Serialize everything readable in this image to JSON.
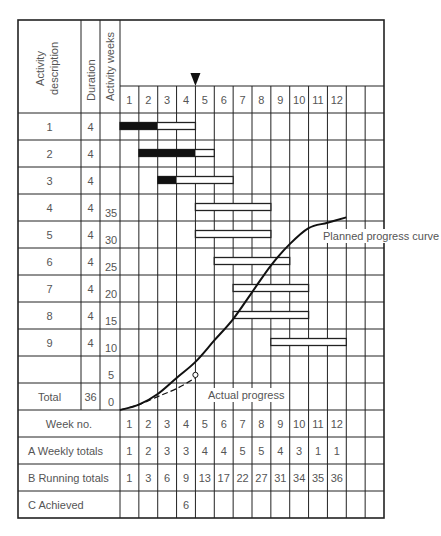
{
  "chart_data": {
    "type": "table",
    "title": "",
    "headers": {
      "activity_description": "Activity description",
      "duration": "Duration",
      "activity_weeks": "Activity weeks"
    },
    "weeks": [
      1,
      2,
      3,
      4,
      5,
      6,
      7,
      8,
      9,
      10,
      11,
      12
    ],
    "current_week_marker": {
      "position_after_week": 4,
      "symbol": "▼"
    },
    "activities": [
      {
        "id": "1",
        "duration": 4,
        "start_week": 1,
        "end_week": 4,
        "completed_weeks": [
          1,
          2
        ]
      },
      {
        "id": "2",
        "duration": 4,
        "start_week": 2,
        "end_week": 5,
        "completed_weeks": [
          2,
          3,
          4
        ]
      },
      {
        "id": "3",
        "duration": 4,
        "start_week": 3,
        "end_week": 6,
        "completed_weeks": [
          3
        ]
      },
      {
        "id": "4",
        "duration": 4,
        "start_week": 5,
        "end_week": 8,
        "completed_weeks": []
      },
      {
        "id": "5",
        "duration": 4,
        "start_week": 5,
        "end_week": 8,
        "completed_weeks": []
      },
      {
        "id": "6",
        "duration": 4,
        "start_week": 6,
        "end_week": 9,
        "completed_weeks": []
      },
      {
        "id": "7",
        "duration": 4,
        "start_week": 7,
        "end_week": 10,
        "completed_weeks": []
      },
      {
        "id": "8",
        "duration": 4,
        "start_week": 7,
        "end_week": 10,
        "completed_weeks": []
      },
      {
        "id": "9",
        "duration": 4,
        "start_week": 9,
        "end_week": 12,
        "completed_weeks": []
      }
    ],
    "total_label": "Total",
    "total_duration": 36,
    "y_axis_ticks": [
      35,
      30,
      25,
      20,
      15,
      10,
      5,
      0
    ],
    "ylim": [
      0,
      36
    ],
    "series": [
      {
        "name": "Planned progress curve",
        "x": [
          0,
          1,
          2,
          3,
          4,
          5,
          6,
          7,
          8,
          9,
          10,
          11,
          12
        ],
        "values": [
          0,
          1,
          3,
          6,
          9,
          13,
          17,
          22,
          27,
          31,
          34,
          35,
          36
        ],
        "style": "solid"
      },
      {
        "name": "Actual progress",
        "x": [
          0,
          1,
          2,
          3,
          4
        ],
        "values": [
          0,
          1,
          2.5,
          4,
          6
        ],
        "style": "dashed"
      }
    ],
    "annotations": [
      "Planned progress curve",
      "Actual progress"
    ],
    "footer_rows": [
      {
        "label": "Week no.",
        "values": [
          "1",
          "2",
          "3",
          "4",
          "5",
          "6",
          "7",
          "8",
          "9",
          "10",
          "11",
          "12",
          "",
          ""
        ]
      },
      {
        "label": "A  Weekly totals",
        "values": [
          "1",
          "2",
          "3",
          "3",
          "4",
          "4",
          "5",
          "5",
          "4",
          "3",
          "1",
          "1",
          "",
          ""
        ]
      },
      {
        "label": "B  Running totals",
        "values": [
          "1",
          "3",
          "6",
          "9",
          "13",
          "17",
          "22",
          "27",
          "31",
          "34",
          "35",
          "36",
          "",
          ""
        ]
      },
      {
        "label": "C  Achieved",
        "values": [
          "",
          "",
          "",
          "6",
          "",
          "",
          "",
          "",
          "",
          "",
          "",
          "",
          "",
          ""
        ]
      }
    ]
  }
}
